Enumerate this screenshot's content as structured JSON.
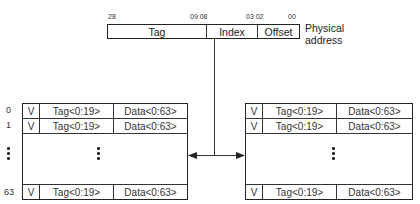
{
  "address": {
    "bit_labels": [
      {
        "text": "28",
        "x": 108
      },
      {
        "text": "09 08",
        "x": 195
      },
      {
        "text": "03 02",
        "x": 247
      },
      {
        "text": "00",
        "x": 288
      }
    ],
    "fields": [
      {
        "label": "Tag",
        "width": 98
      },
      {
        "label": "Index",
        "width": 51
      },
      {
        "label": "Offset",
        "width": 44
      }
    ],
    "caption_line1": "Physical",
    "caption_line2": "address"
  },
  "left_cache": {
    "row_indices": [
      "0",
      "1",
      "63"
    ],
    "rows": [
      {
        "v": "V",
        "tag": "Tag<0:19>",
        "data": "Data<0:63>"
      },
      {
        "v": "V",
        "tag": "Tag<0:19>",
        "data": "Data<0:63>"
      },
      {
        "v": "V",
        "tag": "Tag<0:19>",
        "data": "Data<0:63>"
      }
    ]
  },
  "right_cache": {
    "rows": [
      {
        "v": "V",
        "tag": "Tag<0:19>",
        "data": "Data<0:63>"
      },
      {
        "v": "V",
        "tag": "Tag<0:19>",
        "data": "Data<0:63>"
      },
      {
        "v": "V",
        "tag": "Tag<0:19>",
        "data": "Data<0:63>"
      }
    ]
  }
}
